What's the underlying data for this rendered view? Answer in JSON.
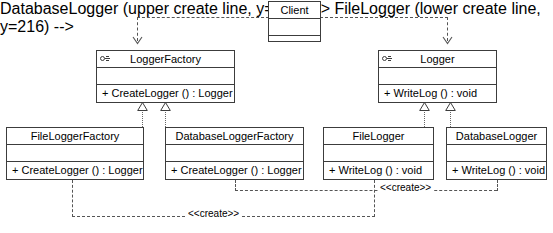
{
  "diagram": {
    "notation": "UML class diagram",
    "stroke_color": "#3c3c3c",
    "background_color": "#ffffff"
  },
  "classes": {
    "client": {
      "name": "Client",
      "attributes": "",
      "operations": "",
      "is_interface": false
    },
    "logger_factory": {
      "name": "LoggerFactory",
      "attributes": "",
      "operations": "+ CreateLogger () : Logger",
      "is_interface": true,
      "interface_icon": "interface-lollipop-icon"
    },
    "logger": {
      "name": "Logger",
      "attributes": "",
      "operations": "+ WriteLog () : void",
      "is_interface": true,
      "interface_icon": "interface-lollipop-icon"
    },
    "file_logger_factory": {
      "name": "FileLoggerFactory",
      "attributes": "",
      "operations": "+ CreateLogger () : Logger",
      "is_interface": false
    },
    "database_logger_factory": {
      "name": "DatabaseLoggerFactory",
      "attributes": "",
      "operations": "+ CreateLogger () : Logger",
      "is_interface": false
    },
    "file_logger": {
      "name": "FileLogger",
      "attributes": "",
      "operations": "+ WriteLog () : void",
      "is_interface": false
    },
    "database_logger": {
      "name": "DatabaseLogger",
      "attributes": "",
      "operations": "+ WriteLog () : void",
      "is_interface": false
    }
  },
  "relationships": {
    "client_to_logger_factory": {
      "type": "dependency",
      "label": ""
    },
    "client_to_logger": {
      "type": "dependency",
      "label": ""
    },
    "file_logger_factory_realizes": {
      "type": "realization",
      "label": ""
    },
    "database_logger_factory_realizes": {
      "type": "realization",
      "label": ""
    },
    "file_logger_realizes": {
      "type": "realization",
      "label": ""
    },
    "database_logger_realizes": {
      "type": "realization",
      "label": ""
    },
    "database_factory_creates_database_logger": {
      "type": "dependency",
      "label": "<<create>>"
    },
    "file_factory_creates_file_logger": {
      "type": "dependency",
      "label": "<<create>>"
    }
  }
}
